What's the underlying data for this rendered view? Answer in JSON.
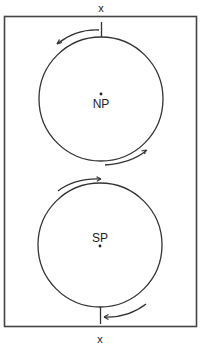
{
  "diagram": {
    "type": "two-pole rotation diagram",
    "colors": {
      "stroke": "#333333",
      "frame": "#444444",
      "background": "#ffffff",
      "text": "#222222"
    },
    "labels": {
      "top_marker": "x",
      "bottom_marker": "x",
      "north_pole": "NP",
      "south_pole": "SP"
    },
    "circles": [
      {
        "name": "north-circle",
        "pole_label": "NP",
        "cx": 101,
        "cy": 99,
        "r": 62
      },
      {
        "name": "south-circle",
        "pole_label": "SP",
        "cx": 100,
        "cy": 245,
        "r": 62
      }
    ],
    "arrows": [
      {
        "name": "top-arrow",
        "position": "upper-left of north circle",
        "direction": "counterclockwise"
      },
      {
        "name": "north-lower-right-arrow",
        "position": "lower-right of north circle",
        "direction": "toward upper-right"
      },
      {
        "name": "south-upper-left-arrow",
        "position": "upper-left of south circle",
        "direction": "toward right"
      },
      {
        "name": "bottom-arrow",
        "position": "lower-right of south circle",
        "direction": "toward left"
      }
    ]
  }
}
